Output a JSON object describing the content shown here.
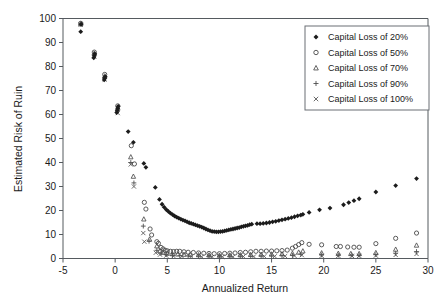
{
  "chart_data": {
    "type": "scatter",
    "title": "",
    "xlabel": "Annualized Return",
    "ylabel": "Estimated Risk of Ruin",
    "xlim": [
      -5,
      30
    ],
    "ylim": [
      0,
      100
    ],
    "xticks": [
      -5,
      0,
      5,
      10,
      15,
      20,
      25,
      30
    ],
    "xtick_labels": [
      "-5",
      "0",
      "5",
      "10",
      "15",
      "20",
      "25",
      "30"
    ],
    "yticks": [
      0,
      10,
      20,
      30,
      40,
      50,
      60,
      70,
      80,
      90,
      100
    ],
    "ytick_labels": [
      "0",
      "10",
      "20",
      "30",
      "40",
      "50",
      "60",
      "70",
      "80",
      "90",
      "100"
    ],
    "grid": false,
    "legend_position": "top-right",
    "series": [
      {
        "name": "Capital Loss of 20%",
        "marker": "filled-diamond",
        "color": "#1c1c1c",
        "points": [
          [
            -3.3,
            94.5
          ],
          [
            -3.25,
            97.6
          ],
          [
            -2.05,
            83.6
          ],
          [
            -2.0,
            84.4
          ],
          [
            -1.95,
            85.3
          ],
          [
            -1.05,
            74.4
          ],
          [
            -1.0,
            75.1
          ],
          [
            -0.95,
            75.8
          ],
          [
            0.15,
            60.8
          ],
          [
            0.2,
            61.6
          ],
          [
            0.25,
            62.6
          ],
          [
            0.3,
            63.4
          ],
          [
            1.25,
            52.9
          ],
          [
            1.75,
            48.4
          ],
          [
            2.75,
            39.6
          ],
          [
            2.95,
            38.0
          ],
          [
            3.85,
            29.6
          ],
          [
            4.25,
            24.6
          ],
          [
            4.5,
            22.6
          ],
          [
            4.7,
            21.4
          ],
          [
            4.9,
            20.4
          ],
          [
            5.1,
            19.6
          ],
          [
            5.3,
            18.9
          ],
          [
            5.5,
            18.3
          ],
          [
            5.7,
            17.7
          ],
          [
            5.9,
            17.2
          ],
          [
            6.1,
            16.8
          ],
          [
            6.3,
            16.4
          ],
          [
            6.5,
            16.0
          ],
          [
            6.7,
            15.7
          ],
          [
            6.9,
            15.3
          ],
          [
            7.1,
            14.9
          ],
          [
            7.3,
            14.6
          ],
          [
            7.5,
            14.3
          ],
          [
            7.7,
            14.0
          ],
          [
            7.9,
            13.7
          ],
          [
            8.1,
            13.4
          ],
          [
            8.3,
            13.1
          ],
          [
            8.5,
            12.7
          ],
          [
            8.7,
            12.3
          ],
          [
            8.9,
            11.9
          ],
          [
            9.1,
            11.6
          ],
          [
            9.3,
            11.3
          ],
          [
            9.5,
            11.2
          ],
          [
            9.7,
            11.1
          ],
          [
            9.9,
            11.1
          ],
          [
            10.1,
            11.2
          ],
          [
            10.3,
            11.3
          ],
          [
            10.5,
            11.5
          ],
          [
            10.7,
            11.7
          ],
          [
            10.9,
            11.9
          ],
          [
            11.1,
            12.1
          ],
          [
            11.3,
            12.3
          ],
          [
            11.5,
            12.5
          ],
          [
            11.7,
            12.7
          ],
          [
            11.9,
            12.9
          ],
          [
            12.1,
            13.2
          ],
          [
            12.3,
            13.4
          ],
          [
            12.5,
            13.6
          ],
          [
            12.7,
            13.8
          ],
          [
            12.9,
            14.1
          ],
          [
            13.1,
            14.3
          ],
          [
            13.6,
            14.5
          ],
          [
            13.9,
            14.5
          ],
          [
            14.2,
            14.6
          ],
          [
            14.5,
            14.8
          ],
          [
            14.8,
            15.0
          ],
          [
            15.1,
            15.3
          ],
          [
            15.4,
            15.5
          ],
          [
            15.7,
            15.8
          ],
          [
            16.0,
            16.1
          ],
          [
            16.3,
            16.4
          ],
          [
            16.6,
            16.7
          ],
          [
            16.9,
            17.0
          ],
          [
            17.2,
            17.4
          ],
          [
            17.5,
            17.8
          ],
          [
            17.8,
            18.1
          ],
          [
            18.0,
            18.4
          ],
          [
            18.6,
            19.2
          ],
          [
            19.6,
            20.3
          ],
          [
            20.6,
            21.0
          ],
          [
            21.9,
            22.4
          ],
          [
            22.4,
            23.3
          ],
          [
            22.9,
            24.1
          ],
          [
            23.4,
            24.9
          ],
          [
            25.0,
            27.7
          ],
          [
            26.9,
            30.4
          ],
          [
            28.9,
            33.3
          ]
        ]
      },
      {
        "name": "Capital Loss of 50%",
        "marker": "open-circle",
        "color": "#4a4a4a",
        "points": [
          [
            -3.3,
            98.0
          ],
          [
            -2.0,
            86.0
          ],
          [
            -1.0,
            76.7
          ],
          [
            0.25,
            63.6
          ],
          [
            1.55,
            47.0
          ],
          [
            1.85,
            39.4
          ],
          [
            2.8,
            23.4
          ],
          [
            2.95,
            20.6
          ],
          [
            3.35,
            12.3
          ],
          [
            3.5,
            9.8
          ],
          [
            4.0,
            7.0
          ],
          [
            4.15,
            6.3
          ],
          [
            4.4,
            4.6
          ],
          [
            4.6,
            4.0
          ],
          [
            4.8,
            3.4
          ],
          [
            5.0,
            3.2
          ],
          [
            5.3,
            3.0
          ],
          [
            5.6,
            2.9
          ],
          [
            5.9,
            3.0
          ],
          [
            6.2,
            3.0
          ],
          [
            6.6,
            2.8
          ],
          [
            7.0,
            2.6
          ],
          [
            7.5,
            2.5
          ],
          [
            8.0,
            2.3
          ],
          [
            8.5,
            2.2
          ],
          [
            9.0,
            2.1
          ],
          [
            9.5,
            2.0
          ],
          [
            10.0,
            2.0
          ],
          [
            10.5,
            2.1
          ],
          [
            11.0,
            2.2
          ],
          [
            11.5,
            2.3
          ],
          [
            12.0,
            2.5
          ],
          [
            12.5,
            2.6
          ],
          [
            13.0,
            2.8
          ],
          [
            13.5,
            3.0
          ],
          [
            14.0,
            3.0
          ],
          [
            14.5,
            3.1
          ],
          [
            15.0,
            3.1
          ],
          [
            15.5,
            3.2
          ],
          [
            16.0,
            3.3
          ],
          [
            16.5,
            3.5
          ],
          [
            17.0,
            4.3
          ],
          [
            17.3,
            5.0
          ],
          [
            17.6,
            5.8
          ],
          [
            17.9,
            6.6
          ],
          [
            18.6,
            5.9
          ],
          [
            19.8,
            5.7
          ],
          [
            21.2,
            5.0
          ],
          [
            21.6,
            5.0
          ],
          [
            22.3,
            4.8
          ],
          [
            22.9,
            4.7
          ],
          [
            23.4,
            4.7
          ],
          [
            25.0,
            6.2
          ],
          [
            26.9,
            8.4
          ],
          [
            28.9,
            10.6
          ]
        ]
      },
      {
        "name": "Capital Loss of 70%",
        "marker": "open-triangle",
        "color": "#555555",
        "points": [
          [
            -3.3,
            97.8
          ],
          [
            -2.0,
            85.5
          ],
          [
            -1.0,
            76.0
          ],
          [
            0.25,
            62.8
          ],
          [
            1.5,
            42.3
          ],
          [
            1.75,
            34.2
          ],
          [
            2.75,
            16.4
          ],
          [
            3.3,
            8.0
          ],
          [
            4.0,
            5.2
          ],
          [
            4.3,
            3.2
          ],
          [
            4.6,
            2.5
          ],
          [
            5.0,
            2.1
          ],
          [
            5.5,
            1.9
          ],
          [
            6.0,
            1.8
          ],
          [
            6.6,
            1.7
          ],
          [
            7.2,
            1.6
          ],
          [
            8.0,
            1.5
          ],
          [
            9.0,
            1.4
          ],
          [
            10.0,
            1.3
          ],
          [
            11.0,
            1.4
          ],
          [
            12.0,
            1.5
          ],
          [
            13.0,
            1.6
          ],
          [
            14.0,
            1.7
          ],
          [
            15.0,
            1.8
          ],
          [
            16.0,
            1.9
          ],
          [
            17.0,
            2.1
          ],
          [
            17.6,
            2.6
          ],
          [
            18.0,
            3.1
          ],
          [
            19.8,
            2.3
          ],
          [
            21.4,
            2.1
          ],
          [
            22.6,
            2.0
          ],
          [
            23.4,
            2.0
          ],
          [
            25.0,
            2.4
          ],
          [
            26.9,
            3.8
          ],
          [
            28.9,
            5.5
          ]
        ]
      },
      {
        "name": "Capital Loss of 90%",
        "marker": "plus",
        "color": "#4f4f4f",
        "points": [
          [
            -3.3,
            97.6
          ],
          [
            -2.0,
            84.8
          ],
          [
            -1.0,
            75.2
          ],
          [
            0.25,
            61.8
          ],
          [
            1.5,
            40.0
          ],
          [
            1.8,
            31.5
          ],
          [
            2.7,
            13.5
          ],
          [
            3.25,
            7.2
          ],
          [
            4.0,
            3.4
          ],
          [
            4.4,
            2.2
          ],
          [
            4.9,
            1.6
          ],
          [
            5.5,
            1.3
          ],
          [
            6.2,
            1.2
          ],
          [
            7.0,
            1.1
          ],
          [
            8.0,
            1.0
          ],
          [
            9.0,
            0.9
          ],
          [
            10.0,
            0.9
          ],
          [
            11.0,
            0.9
          ],
          [
            12.0,
            1.0
          ],
          [
            13.0,
            1.0
          ],
          [
            14.0,
            1.1
          ],
          [
            15.0,
            1.1
          ],
          [
            16.0,
            1.2
          ],
          [
            17.0,
            1.3
          ],
          [
            17.8,
            1.8
          ],
          [
            19.8,
            1.5
          ],
          [
            21.4,
            1.4
          ],
          [
            22.7,
            1.4
          ],
          [
            23.4,
            1.4
          ],
          [
            25.0,
            1.6
          ],
          [
            26.9,
            2.2
          ],
          [
            28.9,
            2.9
          ]
        ]
      },
      {
        "name": "Capital Loss of 100%",
        "marker": "cross-x",
        "color": "#5a5a5a",
        "points": [
          [
            -3.3,
            97.4
          ],
          [
            -2.0,
            84.2
          ],
          [
            -1.0,
            74.6
          ],
          [
            0.25,
            60.6
          ],
          [
            1.5,
            39.2
          ],
          [
            1.8,
            30.0
          ],
          [
            2.7,
            10.6
          ],
          [
            2.8,
            7.0
          ],
          [
            3.9,
            2.4
          ],
          [
            4.3,
            1.6
          ],
          [
            4.9,
            1.2
          ],
          [
            5.6,
            1.0
          ],
          [
            6.4,
            0.9
          ],
          [
            7.3,
            0.8
          ],
          [
            8.3,
            0.7
          ],
          [
            9.3,
            0.7
          ],
          [
            10.3,
            0.7
          ],
          [
            11.3,
            0.7
          ],
          [
            12.3,
            0.8
          ],
          [
            13.3,
            0.8
          ],
          [
            14.3,
            0.9
          ],
          [
            15.3,
            0.9
          ],
          [
            16.3,
            1.0
          ],
          [
            17.2,
            1.1
          ],
          [
            17.9,
            1.4
          ],
          [
            19.8,
            1.1
          ],
          [
            21.4,
            1.1
          ],
          [
            22.7,
            1.1
          ],
          [
            23.4,
            1.1
          ],
          [
            25.0,
            1.2
          ],
          [
            26.9,
            1.5
          ],
          [
            28.9,
            1.9
          ]
        ]
      }
    ]
  },
  "legend": {
    "entries": [
      {
        "label": "Capital Loss of 20%"
      },
      {
        "label": "Capital Loss of 50%"
      },
      {
        "label": "Capital Loss of 70%"
      },
      {
        "label": "Capital Loss of 90%"
      },
      {
        "label": "Capital Loss of 100%"
      }
    ]
  },
  "axes": {
    "x_title": "Annualized Return",
    "y_title": "Estimated Risk of Ruin"
  }
}
